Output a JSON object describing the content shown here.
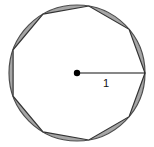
{
  "figure": {
    "type": "geometry-diagram",
    "background_color": "#ffffff",
    "circle": {
      "name": "unit-circle",
      "center": {
        "x": 77,
        "y": 73
      },
      "radius_px": 68,
      "radius_value": "1",
      "stroke_color": "#4d4d4d",
      "stroke_width": 1.2,
      "fill_color": "#a6a6a6"
    },
    "polygon": {
      "name": "inscribed-regular-polygon",
      "sides": 9,
      "inscribed": true,
      "start_angle_deg": 0,
      "fill_color": "#ffffff",
      "stroke_color": "#333333",
      "stroke_width": 1.2,
      "vertices": [
        {
          "x": 145,
          "y": 73
        },
        {
          "x": 129,
          "y": 29
        },
        {
          "x": 91,
          "y": 5
        },
        {
          "x": 47,
          "y": 9
        },
        {
          "x": 16,
          "y": 40
        },
        {
          "x": 10,
          "y": 84
        },
        {
          "x": 36,
          "y": 120
        },
        {
          "x": 77,
          "y": 141
        },
        {
          "x": 119,
          "y": 120
        }
      ]
    },
    "lune_fill_color": "#a6a6a6",
    "center_dot": {
      "name": "center-point",
      "x": 77,
      "y": 73,
      "radius_px": 3.2,
      "color": "#000000"
    },
    "radius_segment": {
      "name": "radius-line",
      "from": {
        "x": 77,
        "y": 73
      },
      "to": {
        "x": 145,
        "y": 73
      },
      "stroke_color": "#111111",
      "stroke_width": 1.1,
      "label": "1"
    }
  }
}
